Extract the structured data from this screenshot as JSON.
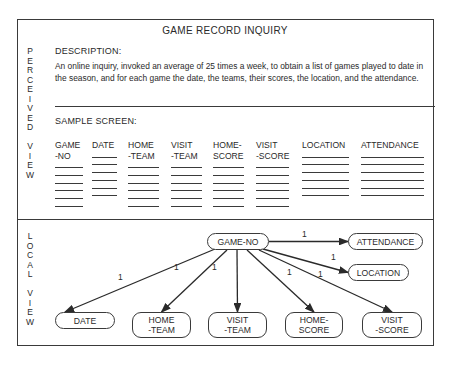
{
  "title": "GAME RECORD INQUIRY",
  "side_labels": {
    "perceived_view": [
      "P",
      "E",
      "R",
      "C",
      "E",
      "I",
      "V",
      "E",
      "D",
      "",
      "V",
      "I",
      "E",
      "W"
    ],
    "local_view": [
      "L",
      "O",
      "C",
      "A",
      "L",
      "",
      "V",
      "I",
      "E",
      "W"
    ]
  },
  "description": {
    "heading": "DESCRIPTION:",
    "text": "An online inquiry, invoked an average of 25 times a week, to obtain a list of games played to date in the season, and for each game the date, the teams, their scores, the location, and the attendance."
  },
  "sample_screen": {
    "heading": "SAMPLE SCREEN:",
    "columns": [
      {
        "label": "GAME\n-NO",
        "x": 55,
        "w": 28
      },
      {
        "label": "DATE",
        "x": 92,
        "w": 25
      },
      {
        "label": "HOME\n-TEAM",
        "x": 128,
        "w": 31
      },
      {
        "label": "VISIT\n-TEAM",
        "x": 171,
        "w": 31
      },
      {
        "label": "HOME-\nSCORE",
        "x": 213,
        "w": 31
      },
      {
        "label": "VISIT\n-SCORE",
        "x": 256,
        "w": 33
      },
      {
        "label": "LOCATION",
        "x": 302,
        "w": 47
      },
      {
        "label": "ATTENDANCE",
        "x": 361,
        "w": 63
      }
    ],
    "blank_rows": 6
  },
  "local_view": {
    "root": {
      "label": "GAME-NO",
      "x": 207,
      "y": 233,
      "w": 62,
      "h": 17
    },
    "entities": [
      {
        "label": "ATTENDANCE",
        "x": 348,
        "y": 233,
        "w": 75,
        "h": 17,
        "cardinality": "1"
      },
      {
        "label": "LOCATION",
        "x": 348,
        "y": 264,
        "w": 61,
        "h": 17,
        "cardinality": "1"
      },
      {
        "label": "DATE",
        "x": 55,
        "y": 312,
        "w": 60,
        "h": 17,
        "cardinality": "1"
      },
      {
        "label": "HOME\n-TEAM",
        "x": 132,
        "y": 312,
        "w": 59,
        "h": 26,
        "cardinality": "1"
      },
      {
        "label": "VISIT\n-TEAM",
        "x": 208,
        "y": 312,
        "w": 59,
        "h": 26,
        "cardinality": "1"
      },
      {
        "label": "HOME-\nSCORE",
        "x": 285,
        "y": 312,
        "w": 58,
        "h": 26,
        "cardinality": "1"
      },
      {
        "label": "VISIT\n-SCORE",
        "x": 362,
        "y": 312,
        "w": 60,
        "h": 26,
        "cardinality": "1"
      }
    ]
  }
}
